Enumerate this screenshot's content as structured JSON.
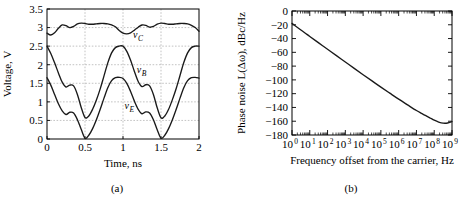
{
  "figure": {
    "panels": [
      {
        "id": "a",
        "subcaption": "(a)",
        "chart_index": 0
      },
      {
        "id": "b",
        "subcaption": "(b)",
        "chart_index": 1
      }
    ]
  },
  "chart_data": [
    {
      "type": "line",
      "title": "",
      "xlabel": "Time, ns",
      "ylabel": "Voltage, V",
      "xlim": [
        0,
        2
      ],
      "ylim": [
        0,
        3.5
      ],
      "xticks": [
        0,
        0.5,
        1,
        1.5,
        2
      ],
      "xtick_labels": [
        "0",
        "0.5",
        "1",
        "1.5",
        "2"
      ],
      "yticks": [
        0,
        0.5,
        1,
        1.5,
        2,
        2.5,
        3,
        3.5
      ],
      "ytick_labels": [
        "0",
        "0.5",
        "1",
        "1.5",
        "2",
        "2.5",
        "3",
        "3.5"
      ],
      "grid": true,
      "legend": "inline-labels",
      "annotations": [
        {
          "text": "v",
          "subscript": "C",
          "x": 1.13,
          "y": 2.72
        },
        {
          "text": "v",
          "subscript": "B",
          "x": 1.18,
          "y": 1.78
        },
        {
          "text": "v",
          "subscript": "E",
          "x": 1.02,
          "y": 0.82
        }
      ],
      "series": [
        {
          "name": "vC",
          "label": "v_C",
          "x": [
            0.0,
            0.05,
            0.1,
            0.15,
            0.2,
            0.25,
            0.3,
            0.35,
            0.4,
            0.45,
            0.5,
            0.55,
            0.6,
            0.65,
            0.7,
            0.75,
            0.8,
            0.85,
            0.9,
            0.95,
            1.0,
            1.05,
            1.1,
            1.15,
            1.2,
            1.25,
            1.3,
            1.35,
            1.4,
            1.45,
            1.5,
            1.55,
            1.6,
            1.65,
            1.7,
            1.75,
            1.8,
            1.85,
            1.9,
            1.95,
            2.0
          ],
          "values": [
            2.85,
            2.8,
            2.86,
            2.98,
            3.07,
            3.05,
            3.0,
            3.03,
            3.1,
            3.12,
            3.11,
            3.09,
            3.09,
            3.1,
            3.11,
            3.11,
            3.1,
            3.07,
            3.02,
            2.92,
            2.85,
            2.83,
            2.86,
            2.93,
            3.01,
            3.07,
            3.06,
            3.01,
            3.03,
            3.09,
            3.12,
            3.11,
            3.09,
            3.09,
            3.1,
            3.11,
            3.11,
            3.1,
            3.06,
            3.0,
            2.9
          ]
        },
        {
          "name": "vB",
          "label": "v_B",
          "x": [
            0.0,
            0.05,
            0.1,
            0.15,
            0.2,
            0.25,
            0.3,
            0.35,
            0.4,
            0.45,
            0.5,
            0.55,
            0.6,
            0.65,
            0.7,
            0.75,
            0.8,
            0.85,
            0.9,
            0.95,
            1.0,
            1.05,
            1.1,
            1.15,
            1.2,
            1.25,
            1.3,
            1.35,
            1.4,
            1.45,
            1.5,
            1.55,
            1.6,
            1.65,
            1.7,
            1.75,
            1.8,
            1.85,
            1.9,
            1.95,
            2.0
          ],
          "values": [
            2.5,
            2.3,
            2.05,
            1.78,
            1.53,
            1.4,
            1.45,
            1.43,
            1.2,
            0.85,
            0.58,
            0.62,
            0.8,
            1.05,
            1.35,
            1.7,
            2.05,
            2.32,
            2.46,
            2.5,
            2.5,
            2.36,
            2.12,
            1.82,
            1.55,
            1.41,
            1.46,
            1.43,
            1.2,
            0.84,
            0.57,
            0.62,
            0.8,
            1.06,
            1.36,
            1.71,
            2.06,
            2.32,
            2.46,
            2.5,
            2.5
          ]
        },
        {
          "name": "vE",
          "label": "v_E",
          "x": [
            0.0,
            0.05,
            0.1,
            0.15,
            0.2,
            0.25,
            0.3,
            0.35,
            0.4,
            0.45,
            0.5,
            0.55,
            0.6,
            0.65,
            0.7,
            0.75,
            0.8,
            0.85,
            0.9,
            0.95,
            1.0,
            1.05,
            1.1,
            1.15,
            1.2,
            1.25,
            1.3,
            1.35,
            1.4,
            1.45,
            1.5,
            1.55,
            1.6,
            1.65,
            1.7,
            1.75,
            1.8,
            1.85,
            1.9,
            1.95,
            2.0
          ],
          "values": [
            1.65,
            1.45,
            1.2,
            0.95,
            0.76,
            0.66,
            0.72,
            0.7,
            0.52,
            0.26,
            0.02,
            0.1,
            0.28,
            0.52,
            0.8,
            1.1,
            1.38,
            1.57,
            1.65,
            1.66,
            1.63,
            1.5,
            1.28,
            1.02,
            0.8,
            0.68,
            0.73,
            0.7,
            0.52,
            0.25,
            0.02,
            0.1,
            0.28,
            0.52,
            0.8,
            1.1,
            1.38,
            1.57,
            1.65,
            1.66,
            1.64
          ]
        }
      ]
    },
    {
      "type": "line",
      "title": "",
      "xlabel": "Frequency offset from the carrier, Hz",
      "ylabel": "Phase noise L(Δω), dBc/Hz",
      "xscale": "log",
      "xlim": [
        1,
        1000000000
      ],
      "ylim": [
        -180,
        0
      ],
      "xticks": [
        1,
        10,
        100,
        1000,
        10000,
        100000,
        1000000,
        10000000,
        100000000,
        1000000000
      ],
      "xtick_labels": [
        "10^0",
        "10^1",
        "10^2",
        "10^3",
        "10^4",
        "10^5",
        "10^6",
        "10^7",
        "10^8",
        "10^9"
      ],
      "xtick_exponents": [
        "0",
        "1",
        "2",
        "3",
        "4",
        "5",
        "6",
        "7",
        "8",
        "9"
      ],
      "xtick_base": "10",
      "yticks": [
        0,
        -20,
        -40,
        -60,
        -80,
        -100,
        -120,
        -140,
        -160,
        -180
      ],
      "ytick_labels": [
        "0",
        "−20",
        "−40",
        "−60",
        "−80",
        "−100",
        "−120",
        "−140",
        "−160",
        "−180"
      ],
      "grid": false,
      "series": [
        {
          "name": "phase-noise",
          "label": "L(Δω)",
          "x_log10": [
            0.0,
            0.25,
            0.5,
            0.75,
            1.0,
            1.5,
            2.0,
            2.5,
            3.0,
            3.5,
            4.0,
            4.5,
            5.0,
            5.5,
            6.0,
            6.5,
            7.0,
            7.25,
            7.5,
            7.75,
            8.0,
            8.25,
            8.5,
            8.75,
            9.0
          ],
          "values": [
            -18.0,
            -22.8,
            -27.5,
            -32.2,
            -37.0,
            -46.3,
            -55.5,
            -64.8,
            -74.0,
            -83.3,
            -92.5,
            -101.5,
            -110.5,
            -119.3,
            -128.0,
            -136.3,
            -144.5,
            -148.2,
            -151.6,
            -155.0,
            -158.5,
            -161.2,
            -162.8,
            -162.6,
            -160.5
          ]
        }
      ]
    }
  ]
}
